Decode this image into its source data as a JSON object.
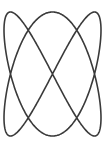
{
  "figure": {
    "title": "Lissajous curve figure",
    "background_color": "#ffffff",
    "stroke_color": "#3a3a3a",
    "stroke_width": 1.6,
    "canvas": {
      "width": 108,
      "height": 145
    }
  },
  "chart_data": {
    "type": "line",
    "title": "",
    "subtitle": "",
    "xlabel": "",
    "ylabel": "",
    "grid": false,
    "legend": null,
    "axes_visible": false,
    "curve_family": "lissajous",
    "parametric": {
      "x_expression": "cx + ax * sin(t)",
      "y_expression": "cy + ay * sin(1.5 * t + phase)",
      "cx": 52.5,
      "cy": 74,
      "ax": 48.5,
      "ay": 62,
      "phase": 1.5707963,
      "t_start": 0,
      "t_end": 12.56637
    },
    "lobes": [
      {
        "name": "top-lobe",
        "apex_y": 12,
        "left_x": 8,
        "right_x": 99,
        "widest_y": 19
      },
      {
        "name": "middle-lobe",
        "left_x": 4,
        "right_x": 101,
        "widest_y": 73
      },
      {
        "name": "bottom-lobe",
        "apex_y": 136,
        "left_x": 8,
        "right_x": 99,
        "widest_y": 129
      }
    ],
    "crossings": [
      {
        "name": "upper-crossing",
        "x": 54,
        "y": 42
      },
      {
        "name": "lower-crossing",
        "x": 54,
        "y": 105
      }
    ],
    "xlim": [
      4,
      101
    ],
    "ylim": [
      12,
      136
    ],
    "x": [],
    "values": []
  }
}
